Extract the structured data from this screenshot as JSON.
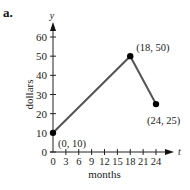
{
  "panel_label": "a.",
  "chart_data": {
    "type": "line",
    "title": "",
    "xlabel": "months",
    "ylabel": "dollars",
    "x_axis_var": "t",
    "y_axis_var": "y",
    "xlim": [
      0,
      24
    ],
    "ylim": [
      0,
      60
    ],
    "x_ticks": [
      0,
      3,
      6,
      9,
      12,
      15,
      18,
      21,
      24
    ],
    "y_ticks": [
      0,
      10,
      20,
      30,
      40,
      50,
      60
    ],
    "grid": false,
    "points": [
      {
        "x": 0,
        "y": 10,
        "label": "(0, 10)"
      },
      {
        "x": 18,
        "y": 50,
        "label": "(18, 50)"
      },
      {
        "x": 24,
        "y": 25,
        "label": "(24, 25)"
      }
    ],
    "line_color": "#555555",
    "marker_color": "#000000"
  }
}
